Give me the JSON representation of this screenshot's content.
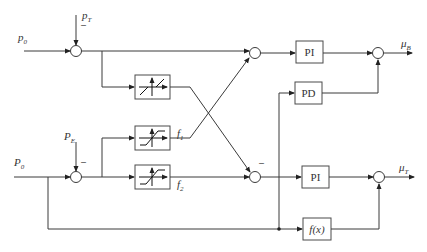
{
  "diagram": {
    "type": "block-diagram",
    "inputs": {
      "p0_top": {
        "main": "p",
        "sub": "0"
      },
      "pT": {
        "main": "p",
        "sub": "T"
      },
      "P0_bottom": {
        "main": "P",
        "sub": "0"
      },
      "PE": {
        "main": "P",
        "sub": "E"
      }
    },
    "outputs": {
      "muB": {
        "main": "μ",
        "sub": "B"
      },
      "muT": {
        "main": "μ",
        "sub": "T"
      }
    },
    "blocks": {
      "pi_top": "PI",
      "pd": "PD",
      "pi_bottom": "PI",
      "fx": "f(x)"
    },
    "nonlinear_labels": {
      "f1": {
        "main": "f",
        "sub": "1"
      },
      "f2": {
        "main": "f",
        "sub": "2"
      }
    },
    "signs": {
      "minus": "–"
    }
  }
}
